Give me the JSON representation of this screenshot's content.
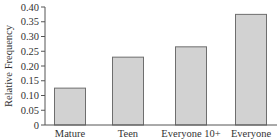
{
  "chart_data": {
    "type": "bar",
    "title": "",
    "xlabel": "",
    "ylabel": "Relative Frequency",
    "categories": [
      "Mature",
      "Teen",
      "Everyone 10+",
      "Everyone"
    ],
    "values": [
      0.125,
      0.23,
      0.265,
      0.375
    ],
    "ylim": [
      0,
      0.4
    ],
    "yticks": [
      0,
      0.05,
      0.1,
      0.15,
      0.2,
      0.25,
      0.3,
      0.35,
      0.4
    ],
    "ytick_labels": [
      "0",
      "0.05",
      "0.10",
      "0.15",
      "0.20",
      "0.25",
      "0.30",
      "0.35",
      "0.40"
    ],
    "grid": false,
    "legend": null,
    "colors": {
      "bar_fill": "#d2d2d2",
      "bar_stroke": "#6e6e6e",
      "axis": "#555555"
    }
  }
}
